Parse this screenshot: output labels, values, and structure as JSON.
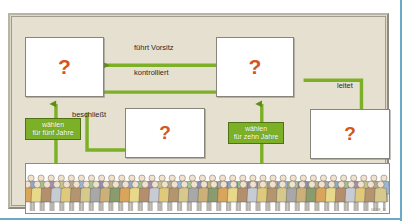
{
  "figure": {
    "title_text": "",
    "watermark": "6028E_11",
    "background_color": "#e6e0d1",
    "accent_color": "#7cb026",
    "question_color": "#d4561f",
    "frame_accent": "#6ba9c4"
  },
  "boxes": [
    {
      "id": "box-top-left",
      "label": "?",
      "name": "question-box-top-left"
    },
    {
      "id": "box-top-right",
      "label": "?",
      "name": "question-box-top-right"
    },
    {
      "id": "box-mid",
      "label": "?",
      "name": "question-box-middle"
    },
    {
      "id": "box-bot-right",
      "label": "?",
      "name": "question-box-bottom-right"
    }
  ],
  "connectors": {
    "fuehrt_vorsitz": "führt Vorsitz",
    "kontrolliert": "kontrolliert",
    "leitet": "leitet",
    "beschliesst": "beschließt"
  },
  "green_labels": {
    "fuenf_jahre_line1": "wählen",
    "fuenf_jahre_line2": "für fünf Jahre",
    "zehn_jahre_line1": "wählen",
    "zehn_jahre_line2": "für zehn Jahre"
  },
  "crowd": {
    "description": "crowd-of-people",
    "row_back_colors": [
      "#8fa8cf",
      "#9ec48a",
      "#a78bb0",
      "#c9c489",
      "#b9a98f",
      "#9bb7d4",
      "#a8c98f",
      "#8f8fb5",
      "#c0b37f",
      "#a9a9a9"
    ],
    "row_front_colors": [
      "#d9a45c",
      "#e8d98a",
      "#b48f6e",
      "#c7cbd4",
      "#e0c97a",
      "#b5956f",
      "#d7c98c",
      "#a8a8a8",
      "#cbb07a",
      "#8a9b6e"
    ],
    "skin_color": "#f2e2cd",
    "outline_color": "#5b5b55",
    "count_back": 36,
    "count_front": 37
  }
}
